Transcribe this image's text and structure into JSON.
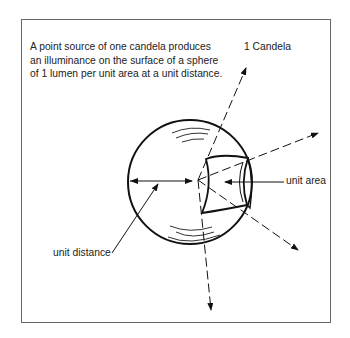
{
  "caption": {
    "lines": [
      "A point source of one candela produces",
      "an illuminance on the surface of a sphere",
      "of 1 lumen per unit area at a unit distance."
    ]
  },
  "labels": {
    "candela": "1 Candela",
    "unit_area": "unit area",
    "unit_distance": "unit distance"
  },
  "colors": {
    "line": "#111111",
    "frame": "#666666",
    "text": "#222222"
  }
}
